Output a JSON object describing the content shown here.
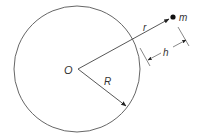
{
  "diagram": {
    "type": "geometry",
    "colors": {
      "stroke": "#444444",
      "text": "#333333",
      "background": "#ffffff"
    },
    "labels": {
      "center": "O",
      "radius": "R",
      "distance": "r",
      "height": "h",
      "mass": "m"
    },
    "geometry": {
      "circle": {
        "cx": 77,
        "cy": 69,
        "r": 63
      },
      "center_point": {
        "x": 77,
        "y": 69
      },
      "mass_point": {
        "x": 173,
        "y": 17
      },
      "radius_arrow_end": {
        "x": 127,
        "y": 106
      },
      "height_dimension": {
        "from": {
          "x": 148,
          "y": 59
        },
        "to": {
          "x": 186,
          "y": 41
        }
      }
    }
  }
}
